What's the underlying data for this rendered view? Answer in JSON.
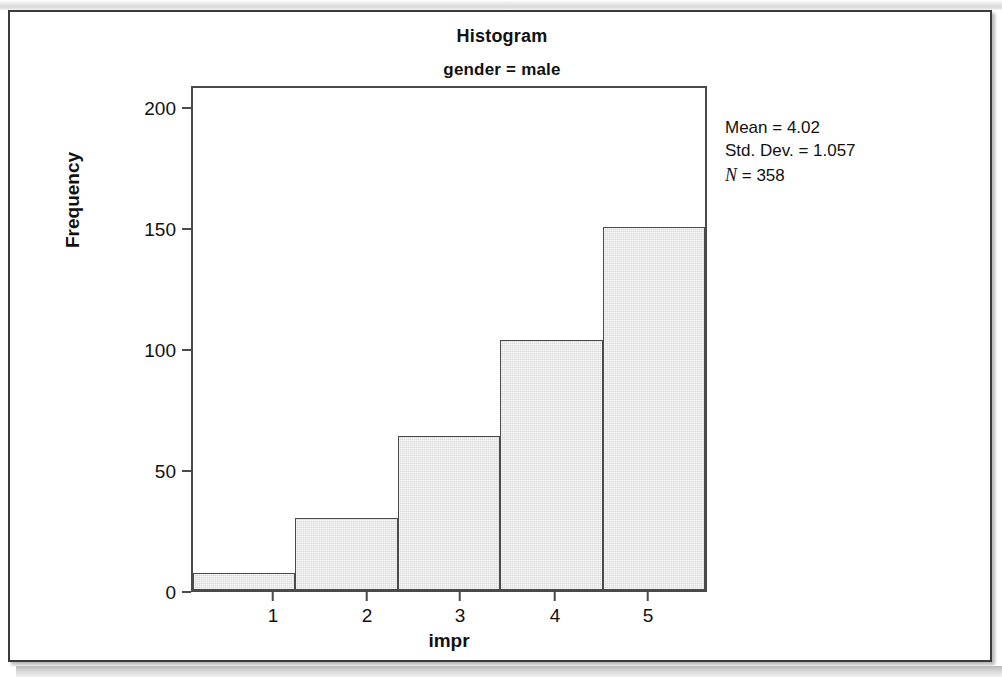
{
  "figure": {
    "title": "Histogram",
    "subtitle": "gender = male"
  },
  "stats": {
    "mean_label": "Mean = 4.02",
    "std_dev_label": "Std. Dev. = 1.057",
    "n_symbol": "N",
    "n_value": " = 358"
  },
  "axes": {
    "y_label": "Frequency",
    "x_label": "impr",
    "y_ticks": [
      "0",
      "50",
      "100",
      "150",
      "200"
    ],
    "x_ticks": [
      "1",
      "2",
      "3",
      "4",
      "5"
    ]
  },
  "colors": {
    "bar_fill": "#d9d9d9",
    "bar_border": "#4a4a4a",
    "frame": "#3a3a3a",
    "text": "#111111"
  },
  "chart_data": {
    "type": "bar",
    "title": "Histogram",
    "subtitle": "gender = male",
    "xlabel": "impr",
    "ylabel": "Frequency",
    "categories": [
      "1",
      "2",
      "3",
      "4",
      "5"
    ],
    "values": [
      7,
      30,
      64,
      104,
      151
    ],
    "ylim": [
      0,
      209
    ],
    "yticks": [
      0,
      50,
      100,
      150,
      200
    ],
    "xlim": [
      0.5,
      5.5
    ],
    "xticks": [
      1,
      2,
      3,
      4,
      5
    ],
    "grid": false,
    "legend": null,
    "annotations": [
      "Mean = 4.02",
      "Std. Dev. = 1.057",
      "N = 358"
    ],
    "statistics": {
      "mean": 4.02,
      "std_dev": 1.057,
      "n": 358
    }
  }
}
